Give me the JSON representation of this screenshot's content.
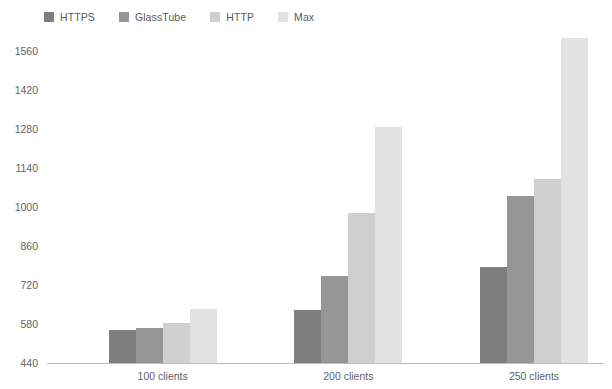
{
  "chart_data": {
    "type": "bar",
    "title": "",
    "subtitle": "",
    "xlabel": "",
    "ylabel": "",
    "categories": [
      "100 clients",
      "200 clients",
      "250 clients"
    ],
    "series": [
      {
        "name": "HTTPS",
        "color": "#7f7f7f",
        "values": [
          563,
          635,
          787
        ]
      },
      {
        "name": "GlassTube",
        "color": "#969696",
        "values": [
          571,
          757,
          1045
        ]
      },
      {
        "name": "HTTP",
        "color": "#cfcfcf",
        "values": [
          586,
          982,
          1105
        ]
      },
      {
        "name": "Max",
        "color": "#e2e2e2",
        "values": [
          639,
          1292,
          1612
        ]
      }
    ],
    "ylim": [
      440,
      1600
    ],
    "yticks": [
      440,
      580,
      720,
      860,
      1000,
      1140,
      1280,
      1420,
      1560
    ],
    "ytick_labels": [
      "440",
      "580",
      "720",
      "860",
      "1000",
      "1140",
      "1280",
      "1420",
      "1560"
    ],
    "grid": false,
    "legend_position": "top-left",
    "axis_color": "#bdbdbd",
    "tick_label_color": "#636363",
    "background": "#ffffff"
  },
  "legend": {
    "items": [
      {
        "label": "HTTPS",
        "swatch": "#7f7f7f"
      },
      {
        "label": "GlassTube",
        "swatch": "#969696"
      },
      {
        "label": "HTTP",
        "swatch": "#cfcfcf"
      },
      {
        "label": "Max",
        "swatch": "#e2e2e2"
      }
    ]
  }
}
